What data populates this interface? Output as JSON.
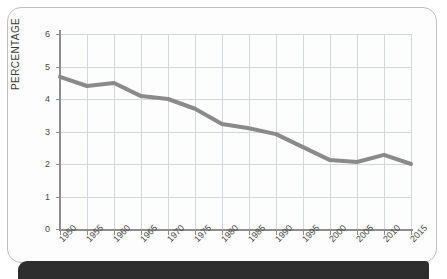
{
  "figure": {
    "frame_border_color": "#bfbfbf",
    "background_color": "#fdfdfd",
    "bottom_bar_color": "#2e2e2e",
    "grid_color": "#d2d6dd",
    "axis_color": "#8d8d8d"
  },
  "chart_data": {
    "type": "line",
    "title": "",
    "subtitle": "",
    "xlabel": "",
    "ylabel": "PERCENTAGE",
    "xlim": [
      1950,
      2015
    ],
    "ylim": [
      0,
      6
    ],
    "grid": true,
    "legend": false,
    "legend_position": "none",
    "line_color": "#8a8a8a",
    "line_width": 4,
    "y_ticks": [
      "0",
      "1",
      "2",
      "3",
      "4",
      "5",
      "6"
    ],
    "y_tick_values": [
      0,
      1,
      2,
      3,
      4,
      5,
      6
    ],
    "x_ticks": [
      "1950",
      "1955",
      "1960",
      "1965",
      "1970",
      "1975",
      "1980",
      "1985",
      "1990",
      "1995",
      "2000",
      "2005",
      "2010",
      "2015"
    ],
    "x": [
      1950,
      1955,
      1960,
      1965,
      1970,
      1975,
      1980,
      1985,
      1990,
      1995,
      2000,
      2005,
      2010,
      2015
    ],
    "values": [
      4.68,
      4.4,
      4.49,
      4.09,
      4.0,
      3.7,
      3.23,
      3.1,
      2.92,
      2.52,
      2.12,
      2.06,
      2.28,
      2.0
    ],
    "series": [
      {
        "name": "Percentage",
        "values": [
          4.68,
          4.4,
          4.49,
          4.09,
          4.0,
          3.7,
          3.23,
          3.1,
          2.92,
          2.52,
          2.12,
          2.06,
          2.28,
          2.0
        ]
      }
    ],
    "annotations": []
  }
}
